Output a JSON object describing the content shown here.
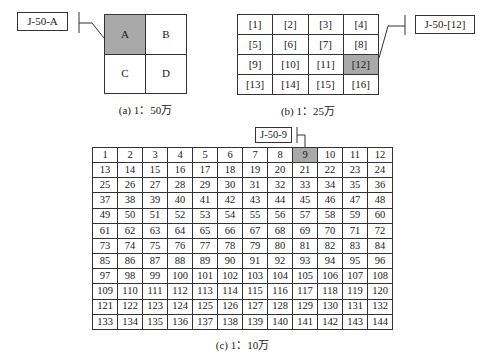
{
  "panel_a": {
    "label": "J-50-A",
    "cells": [
      [
        "A",
        "B"
      ],
      [
        "C",
        "D"
      ]
    ],
    "highlighted": "A",
    "caption": "(a) 1：50万"
  },
  "panel_b": {
    "label": "J-50-[12]",
    "cells": [
      [
        "[1]",
        "[2]",
        "[3]",
        "[4]"
      ],
      [
        "[5]",
        "[6]",
        "[7]",
        "[8]"
      ],
      [
        "[9]",
        "[10]",
        "[11]",
        "[12]"
      ],
      [
        "[13]",
        "[14]",
        "[15]",
        "[16]"
      ]
    ],
    "highlighted": "[12]",
    "caption": "(b) 1：25万"
  },
  "panel_c": {
    "label": "J-50-9",
    "rows": 12,
    "cols": 12,
    "highlighted": "9",
    "caption": "(c) 1：10万"
  },
  "colors": {
    "highlight": "#a9a9a9",
    "border": "#333333"
  }
}
